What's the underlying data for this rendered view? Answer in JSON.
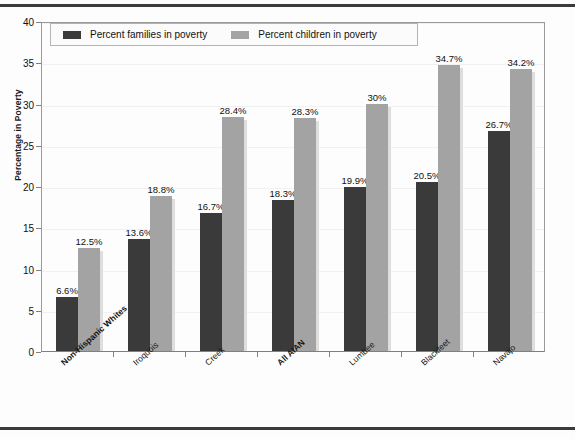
{
  "chart_data": {
    "type": "bar",
    "title": "",
    "subtitle": "",
    "xlabel": "",
    "ylabel": "Percentage in Poverty",
    "ylim": [
      0,
      40
    ],
    "yticks": [
      0,
      5,
      10,
      15,
      20,
      25,
      30,
      35,
      40
    ],
    "ytick_labels": [
      "0",
      "5",
      "10",
      "15",
      "20",
      "25",
      "30",
      "35",
      "40"
    ],
    "grid": true,
    "legend_position": "top-left",
    "categories": [
      "Non-Hispanic Whites",
      "Iroquois",
      "Creek",
      "All AIAN",
      "Lumbee",
      "Blackfeet",
      "Navajo"
    ],
    "categories_bold": [
      true,
      false,
      false,
      true,
      false,
      false,
      false
    ],
    "series": [
      {
        "name": "Percent families in poverty",
        "color": "#3a3a3a",
        "values": [
          6.6,
          13.6,
          16.7,
          18.3,
          19.9,
          20.5,
          26.7
        ],
        "labels": [
          "6.6%",
          "13.6%",
          "16.7%",
          "18.3%",
          "19.9%",
          "20.5%",
          "26.7%"
        ]
      },
      {
        "name": "Percent children in poverty",
        "color": "#a3a3a3",
        "values": [
          12.5,
          18.8,
          28.4,
          28.3,
          30.0,
          34.7,
          34.2
        ],
        "labels": [
          "12.5%",
          "18.8%",
          "28.4%",
          "28.3%",
          "30%",
          "34.7%",
          "34.2%"
        ]
      }
    ]
  },
  "legend": {
    "items": [
      {
        "label": "Percent families in poverty",
        "color": "#3a3a3a"
      },
      {
        "label": "Percent children in poverty",
        "color": "#a3a3a3"
      }
    ]
  }
}
